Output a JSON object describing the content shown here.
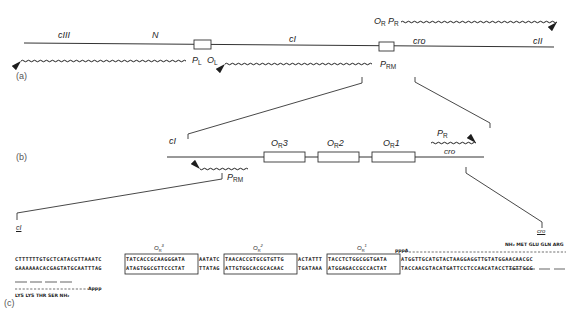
{
  "panels": {
    "a": "(a)",
    "b": "(b)",
    "c": "(c)"
  },
  "panel_a": {
    "genes": [
      "cIII",
      "N",
      "cI",
      "cro",
      "cII"
    ],
    "promoters": {
      "PL": {
        "main": "P",
        "sub": "L"
      },
      "OL": {
        "main": "O",
        "sub": "L"
      },
      "OR": {
        "main": "O",
        "sub": "R"
      },
      "PR": {
        "main": "P",
        "sub": "R"
      },
      "PRM": {
        "main": "P",
        "sub": "RM"
      }
    }
  },
  "panel_b": {
    "gene_left": "cI",
    "gene_right": "cro",
    "operators": [
      {
        "main": "O",
        "sub": "R",
        "num": "3"
      },
      {
        "main": "O",
        "sub": "R",
        "num": "2"
      },
      {
        "main": "O",
        "sub": "R",
        "num": "1"
      }
    ],
    "PR": {
      "main": "P",
      "sub": "R"
    },
    "PRM": {
      "main": "P",
      "sub": "RM"
    }
  },
  "panel_c": {
    "left_label": "cI",
    "right_label": "cro",
    "operator_labels": [
      {
        "main": "O",
        "sub": "R",
        "num": "3"
      },
      {
        "main": "O",
        "sub": "R",
        "num": "2"
      },
      {
        "main": "O",
        "sub": "R",
        "num": "1"
      }
    ],
    "top_strand": [
      "CTTTTTTGTGCTCATACGTTAAATC",
      "TATCACCGCAAGGGATA",
      "AATATC",
      "TAACACCGTGCGTGTTG",
      "ACTATTT",
      "TACCTCTGGCGGTGATA",
      "ATGGTTGCATGTACTAAGGAGGTTGTATGGAACAACGC"
    ],
    "bottom_strand": [
      "GAAAAAACACGAGTATGCAATTTAG",
      "ATAGTGGCGTTCCCTAT",
      "TTATAG",
      "ATTGTGGCACGCACAAC",
      "TGATAAA",
      "ATGGAGACCGCCACTAT",
      "TACCAACGTACATGATTCCTCCAACATACCTTGTTGCG"
    ],
    "pppA_right": "pppA",
    "pppA_left_end": "Appp",
    "cro_peptide": "NH₂ MET GLU GLN ARG",
    "ci_peptide": "LYS LYS THR SER NH₂"
  }
}
